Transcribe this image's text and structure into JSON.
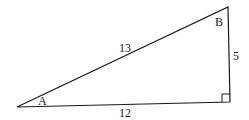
{
  "diagram": {
    "vertices": {
      "A": {
        "label": "A"
      },
      "B": {
        "label": "B"
      }
    },
    "sides": {
      "hypotenuse": {
        "label": "13"
      },
      "vertical": {
        "label": "5"
      },
      "base": {
        "label": "12"
      }
    },
    "right_angle_marker": true,
    "colors": {
      "stroke": "#1a1a1a",
      "background": "#ffffff"
    }
  }
}
